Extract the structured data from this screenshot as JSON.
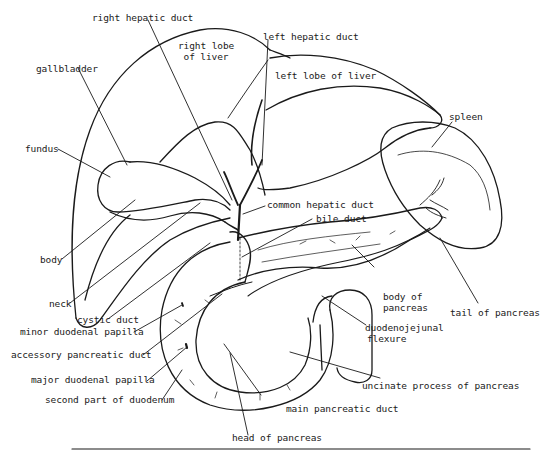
{
  "figure": {
    "labels": {
      "right_hepatic_duct": "right hepatic duct",
      "right_lobe_line1": "right lobe",
      "right_lobe_line2": "of liver",
      "left_hepatic_duct": "left hepatic duct",
      "left_lobe": "left lobe of liver",
      "gallbladder": "gallbladder",
      "spleen": "spleen",
      "fundus": "fundus",
      "common_hepatic_duct": "common hepatic duct",
      "bile_duct": "bile duct",
      "body": "body",
      "body_of_pancreas_line1": "body of",
      "body_of_pancreas_line2": "pancreas",
      "tail_of_pancreas": "tail of pancreas",
      "neck": "neck",
      "cystic_duct": "cystic duct",
      "minor_duodenal_papilla": "minor duodenal papilla",
      "duodenojejunal_line1": "duodenojejunal",
      "duodenojejunal_line2": "flexure",
      "accessory_pancreatic_duct": "accessory pancreatic duct",
      "major_duodenal_papilla": "major duodenal papilla",
      "uncinate_process": "uncinate process of pancreas",
      "second_part_duodenum": "second part of duodenum",
      "main_pancreatic_duct": "main pancreatic duct",
      "head_of_pancreas": "head of pancreas"
    }
  }
}
